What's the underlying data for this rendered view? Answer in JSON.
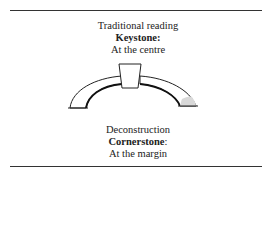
{
  "top": {
    "line1": "Traditional reading",
    "line2": "Keystone:",
    "line3": "At the centre"
  },
  "bottom": {
    "line1": "Deconstruction",
    "line2_bold": "Cornerstone",
    "line2_rest": ":",
    "line3": "At the margin"
  },
  "diagram": {
    "shape": "arch-icon",
    "keystone_fill": "#ffffff",
    "cornerstone_fill": "#d9d9d9"
  }
}
